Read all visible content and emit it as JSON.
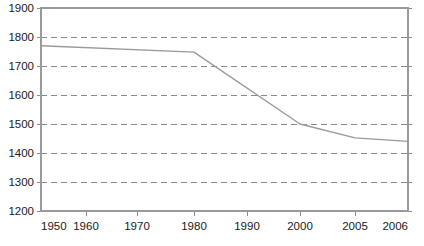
{
  "chart_data": {
    "type": "line",
    "title": "",
    "subtitle": "",
    "xlabel": "",
    "ylabel": "",
    "x": [
      1950,
      1960,
      1970,
      1980,
      1990,
      2000,
      2005,
      2006
    ],
    "series": [
      {
        "name": "",
        "values": [
          1770,
          1763,
          1755,
          1748,
          1625,
          1500,
          1452,
          1440
        ]
      }
    ],
    "xlim": [
      1950,
      2006
    ],
    "ylim": [
      1200,
      1900
    ],
    "xticks": [
      1950,
      1960,
      1970,
      1980,
      1990,
      2000,
      2005,
      2006
    ],
    "xtick_labels": [
      "1950",
      "1960",
      "1970",
      "1980",
      "1990",
      "2000",
      "2005",
      "2006"
    ],
    "xtick_positions": [
      41,
      86,
      137,
      194,
      247,
      300,
      355,
      408
    ],
    "yticks": [
      1200,
      1300,
      1400,
      1500,
      1600,
      1700,
      1800,
      1900
    ],
    "ytick_labels": [
      "1200",
      "1300",
      "1400",
      "1500",
      "1600",
      "1700",
      "1800",
      "1900"
    ],
    "gridlines": [
      1300,
      1400,
      1500,
      1600,
      1700,
      1800
    ],
    "grid": true,
    "grid_style": "dashed-horizontal",
    "legend": false,
    "legend_position": "none",
    "annotations": [],
    "colors": {
      "line": "#9a9a9a",
      "grid": "#8a8a8a",
      "axis": "#9a9a9a",
      "text": "#1a1a1a",
      "background": "#ffffff"
    },
    "vertices": [
      {
        "year": 1950,
        "value": 1770
      },
      {
        "year": 1980,
        "value": 1748
      },
      {
        "year": 2000,
        "value": 1500
      },
      {
        "year": 2005,
        "value": 1452
      },
      {
        "year": 2006,
        "value": 1440
      }
    ]
  }
}
